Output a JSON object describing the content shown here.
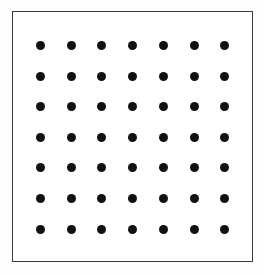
{
  "figure": {
    "canvas": {
      "width": 265,
      "height": 275
    },
    "background_color": "#fefefe"
  },
  "frame": {
    "name": "outer rectangle border",
    "x": 12,
    "y": 11,
    "width": 241,
    "height": 251,
    "stroke_color": "#3a3a3a",
    "stroke_width": 1.6,
    "fill_color": "#ffffff"
  },
  "chart_data": {
    "type": "scatter",
    "title": "",
    "subtitle": "",
    "xlabel": "",
    "ylabel": "",
    "grid": false,
    "legend_position": "none",
    "rows": 7,
    "columns": 7,
    "point_count": 49,
    "marker": {
      "shape": "circle",
      "diameter_px": 9,
      "color": "#111111",
      "filled": true
    },
    "origin": {
      "x": 40.5,
      "y": 45.5
    },
    "spacing": {
      "x": 30.7,
      "y": 30.6
    },
    "xlim": [
      12,
      253
    ],
    "ylim": [
      11,
      262
    ],
    "x_tick_labels": [],
    "y_tick_labels": [],
    "x": [
      40.5,
      71.2,
      101.9,
      132.6,
      163.3,
      194.0,
      224.7
    ],
    "y": [
      45.5,
      76.1,
      106.7,
      137.3,
      167.9,
      198.5,
      229.1
    ],
    "points": [
      {
        "col": 0,
        "row": 0,
        "cx": 40.5,
        "cy": 45.5
      },
      {
        "col": 1,
        "row": 0,
        "cx": 71.2,
        "cy": 45.5
      },
      {
        "col": 2,
        "row": 0,
        "cx": 101.9,
        "cy": 45.5
      },
      {
        "col": 3,
        "row": 0,
        "cx": 132.6,
        "cy": 45.5
      },
      {
        "col": 4,
        "row": 0,
        "cx": 163.3,
        "cy": 45.5
      },
      {
        "col": 5,
        "row": 0,
        "cx": 194.0,
        "cy": 45.5
      },
      {
        "col": 6,
        "row": 0,
        "cx": 224.7,
        "cy": 45.5
      },
      {
        "col": 0,
        "row": 1,
        "cx": 40.5,
        "cy": 76.1
      },
      {
        "col": 1,
        "row": 1,
        "cx": 71.2,
        "cy": 76.1
      },
      {
        "col": 2,
        "row": 1,
        "cx": 101.9,
        "cy": 76.1
      },
      {
        "col": 3,
        "row": 1,
        "cx": 132.6,
        "cy": 76.1
      },
      {
        "col": 4,
        "row": 1,
        "cx": 163.3,
        "cy": 76.1
      },
      {
        "col": 5,
        "row": 1,
        "cx": 194.0,
        "cy": 76.1
      },
      {
        "col": 6,
        "row": 1,
        "cx": 224.7,
        "cy": 76.1
      },
      {
        "col": 0,
        "row": 2,
        "cx": 40.5,
        "cy": 106.7
      },
      {
        "col": 1,
        "row": 2,
        "cx": 71.2,
        "cy": 106.7
      },
      {
        "col": 2,
        "row": 2,
        "cx": 101.9,
        "cy": 106.7
      },
      {
        "col": 3,
        "row": 2,
        "cx": 132.6,
        "cy": 106.7
      },
      {
        "col": 4,
        "row": 2,
        "cx": 163.3,
        "cy": 106.7
      },
      {
        "col": 5,
        "row": 2,
        "cx": 194.0,
        "cy": 106.7
      },
      {
        "col": 6,
        "row": 2,
        "cx": 224.7,
        "cy": 106.7
      },
      {
        "col": 0,
        "row": 3,
        "cx": 40.5,
        "cy": 137.3
      },
      {
        "col": 1,
        "row": 3,
        "cx": 71.2,
        "cy": 137.3
      },
      {
        "col": 2,
        "row": 3,
        "cx": 101.9,
        "cy": 137.3
      },
      {
        "col": 3,
        "row": 3,
        "cx": 132.6,
        "cy": 137.3
      },
      {
        "col": 4,
        "row": 3,
        "cx": 163.3,
        "cy": 137.3
      },
      {
        "col": 5,
        "row": 3,
        "cx": 194.0,
        "cy": 137.3
      },
      {
        "col": 6,
        "row": 3,
        "cx": 224.7,
        "cy": 137.3
      },
      {
        "col": 0,
        "row": 4,
        "cx": 40.5,
        "cy": 167.9
      },
      {
        "col": 1,
        "row": 4,
        "cx": 71.2,
        "cy": 167.9
      },
      {
        "col": 2,
        "row": 4,
        "cx": 101.9,
        "cy": 167.9
      },
      {
        "col": 3,
        "row": 4,
        "cx": 132.6,
        "cy": 167.9
      },
      {
        "col": 4,
        "row": 4,
        "cx": 163.3,
        "cy": 167.9
      },
      {
        "col": 5,
        "row": 4,
        "cx": 194.0,
        "cy": 167.9
      },
      {
        "col": 6,
        "row": 4,
        "cx": 224.7,
        "cy": 167.9
      },
      {
        "col": 0,
        "row": 5,
        "cx": 40.5,
        "cy": 198.5
      },
      {
        "col": 1,
        "row": 5,
        "cx": 71.2,
        "cy": 198.5
      },
      {
        "col": 2,
        "row": 5,
        "cx": 101.9,
        "cy": 198.5
      },
      {
        "col": 3,
        "row": 5,
        "cx": 132.6,
        "cy": 198.5
      },
      {
        "col": 4,
        "row": 5,
        "cx": 163.3,
        "cy": 198.5
      },
      {
        "col": 5,
        "row": 5,
        "cx": 194.0,
        "cy": 198.5
      },
      {
        "col": 6,
        "row": 5,
        "cx": 224.7,
        "cy": 198.5
      },
      {
        "col": 0,
        "row": 6,
        "cx": 40.5,
        "cy": 229.1
      },
      {
        "col": 1,
        "row": 6,
        "cx": 71.2,
        "cy": 229.1
      },
      {
        "col": 2,
        "row": 6,
        "cx": 101.9,
        "cy": 229.1
      },
      {
        "col": 3,
        "row": 6,
        "cx": 132.6,
        "cy": 229.1
      },
      {
        "col": 4,
        "row": 6,
        "cx": 163.3,
        "cy": 229.1
      },
      {
        "col": 5,
        "row": 6,
        "cx": 194.0,
        "cy": 229.1
      },
      {
        "col": 6,
        "row": 6,
        "cx": 224.7,
        "cy": 229.1
      }
    ],
    "annotations": []
  }
}
